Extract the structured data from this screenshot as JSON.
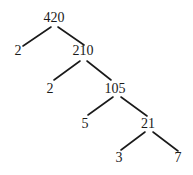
{
  "diagram": {
    "type": "factor-tree",
    "nodes": [
      {
        "id": "n420",
        "label": "420",
        "x": 54,
        "y": 22
      },
      {
        "id": "n2a",
        "label": "2",
        "x": 18,
        "y": 55
      },
      {
        "id": "n210",
        "label": "210",
        "x": 83,
        "y": 55
      },
      {
        "id": "n2b",
        "label": "2",
        "x": 50,
        "y": 93
      },
      {
        "id": "n105",
        "label": "105",
        "x": 115,
        "y": 93
      },
      {
        "id": "n5",
        "label": "5",
        "x": 85,
        "y": 128
      },
      {
        "id": "n21",
        "label": "21",
        "x": 148,
        "y": 128
      },
      {
        "id": "n3",
        "label": "3",
        "x": 119,
        "y": 162
      },
      {
        "id": "n7",
        "label": "7",
        "x": 178,
        "y": 162
      }
    ],
    "edges": [
      {
        "from": "n420",
        "to": "n2a",
        "x1": 51,
        "y1": 27,
        "x2": 23,
        "y2": 46
      },
      {
        "from": "n420",
        "to": "n210",
        "x1": 58,
        "y1": 27,
        "x2": 84,
        "y2": 45
      },
      {
        "from": "n210",
        "to": "n2b",
        "x1": 80,
        "y1": 61,
        "x2": 54,
        "y2": 80
      },
      {
        "from": "n210",
        "to": "n105",
        "x1": 87,
        "y1": 61,
        "x2": 111,
        "y2": 80
      },
      {
        "from": "n105",
        "to": "n5",
        "x1": 113,
        "y1": 97,
        "x2": 88,
        "y2": 115
      },
      {
        "from": "n105",
        "to": "n21",
        "x1": 121,
        "y1": 97,
        "x2": 147,
        "y2": 116
      },
      {
        "from": "n21",
        "to": "n3",
        "x1": 145,
        "y1": 132,
        "x2": 121,
        "y2": 150
      },
      {
        "from": "n21",
        "to": "n7",
        "x1": 153,
        "y1": 132,
        "x2": 178,
        "y2": 151
      }
    ]
  }
}
